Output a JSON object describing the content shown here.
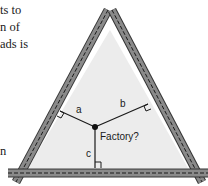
{
  "text_fragments": [
    "ts to",
    "n of",
    "ads is",
    "n"
  ],
  "diagram": {
    "labels": {
      "a": "a",
      "b": "b",
      "c": "c",
      "factory": "Factory?"
    },
    "colors": {
      "road_fill": "#8a8a8a",
      "road_edge": "#333333",
      "road_dash": "#1a1a1a",
      "interior": "#ececec",
      "lines": "#1a1a1a"
    }
  }
}
